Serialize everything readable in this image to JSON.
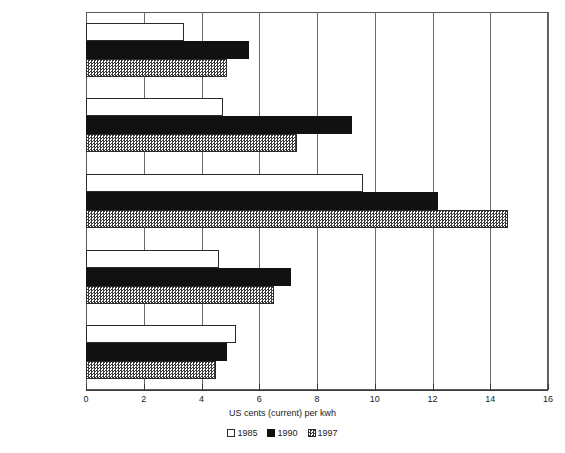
{
  "chart_data": {
    "type": "bar",
    "orientation": "horizontal",
    "title": "",
    "xlabel": "US cents (current) per kwh",
    "ylabel": "",
    "xlim": [
      0,
      16
    ],
    "xticks": [
      0,
      2,
      4,
      6,
      8,
      10,
      12,
      14,
      16
    ],
    "xtick_labels": [
      "0",
      "2",
      "4",
      "6",
      "8",
      "10",
      "12",
      "14",
      "16"
    ],
    "grid": true,
    "grid_axis": "x",
    "legend_position": "bottom",
    "categories": [
      "France",
      "Germany",
      "Japan",
      "United Kingdom",
      "United States"
    ],
    "series": [
      {
        "name": "1985",
        "style": "white",
        "values": [
          3.4,
          4.75,
          9.6,
          4.6,
          5.2
        ]
      },
      {
        "name": "1990",
        "style": "black",
        "values": [
          5.65,
          9.2,
          12.2,
          7.1,
          4.9
        ]
      },
      {
        "name": "1997",
        "style": "hatched",
        "values": [
          4.9,
          7.3,
          14.6,
          6.5,
          4.5
        ]
      }
    ]
  },
  "legend": {
    "entries": [
      {
        "label": "1985"
      },
      {
        "label": "1990"
      },
      {
        "label": "1997"
      }
    ]
  },
  "colors": {
    "series_1985": "#ffffff",
    "series_1990": "#111111",
    "series_1997": "#3a3a3a",
    "axis": "#3a3a3a",
    "grid": "#6a6a6a",
    "text": "#1a1a1a",
    "background": "#ffffff"
  }
}
